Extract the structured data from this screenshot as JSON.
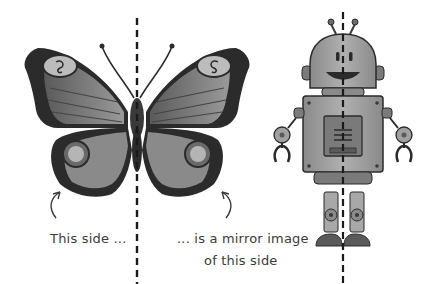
{
  "figure": {
    "subjects": [
      {
        "name": "butterfly",
        "symmetry_line": "vertical dashed"
      },
      {
        "name": "robot",
        "symmetry_line": "vertical dashed"
      }
    ],
    "annotations": {
      "left_label": "This side ...",
      "right_label_line1": "... is a mirror image",
      "right_label_line2": "of this side"
    },
    "colors": {
      "background": "#ffffff",
      "line": "#1a1a1a",
      "wing_dark": "#2b2b2b",
      "wing_mid": "#6e6e6e",
      "wing_light": "#a8a8a8",
      "robot_body": "#9a9a9a",
      "robot_dark": "#4a4a4a",
      "text": "#3a3a3a"
    }
  }
}
